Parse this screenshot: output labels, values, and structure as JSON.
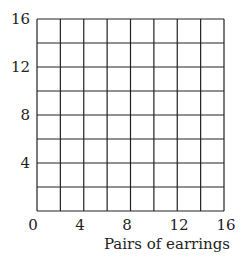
{
  "chart_data": {
    "type": "scatter",
    "title": "",
    "xlabel": "Pairs of earrings",
    "ylabel": "",
    "xlim": [
      0,
      16
    ],
    "ylim": [
      0,
      16
    ],
    "x_ticks": [
      0,
      4,
      8,
      12,
      16
    ],
    "y_ticks": [
      4,
      8,
      12,
      16
    ],
    "grid": true,
    "grid_step": 2,
    "series": [],
    "legend": null
  },
  "labels": {
    "x0": "0",
    "x4": "4",
    "x8": "8",
    "x12": "12",
    "x16": "16",
    "y4": "4",
    "y8": "8",
    "y12": "12",
    "y16": "16",
    "xlabel": "Pairs of earrings"
  },
  "colors": {
    "grid": "#222222",
    "background": "#ffffff"
  }
}
